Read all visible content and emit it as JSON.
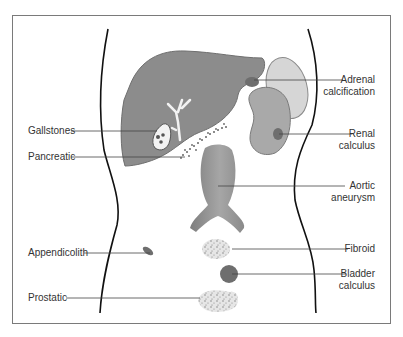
{
  "diagram": {
    "labels_left": [
      {
        "id": "gallstones",
        "text": "Gallstones"
      },
      {
        "id": "pancreatic",
        "text": "Pancreatic"
      },
      {
        "id": "appendicolith",
        "text": "Appendicolith"
      },
      {
        "id": "prostatic",
        "text": "Prostatic"
      }
    ],
    "labels_right": [
      {
        "id": "adrenal",
        "line1": "Adrenal",
        "line2": "calcification"
      },
      {
        "id": "renal",
        "line1": "Renal",
        "line2": "calculus"
      },
      {
        "id": "aortic",
        "line1": "Aortic",
        "line2": "aneurysm"
      },
      {
        "id": "fibroid",
        "line1": "Fibroid",
        "line2": ""
      },
      {
        "id": "bladder",
        "line1": "Bladder",
        "line2": "calculus"
      }
    ],
    "colors": {
      "liver": "#8c8c8c",
      "kidney": "#a9a9a9",
      "kidney_back": "#d6d6d6",
      "aorta": "#8f8f8f",
      "stone": "#6e6e6e",
      "outline": "#111111",
      "leader": "#444444",
      "frame": "#7a7a7a"
    }
  }
}
